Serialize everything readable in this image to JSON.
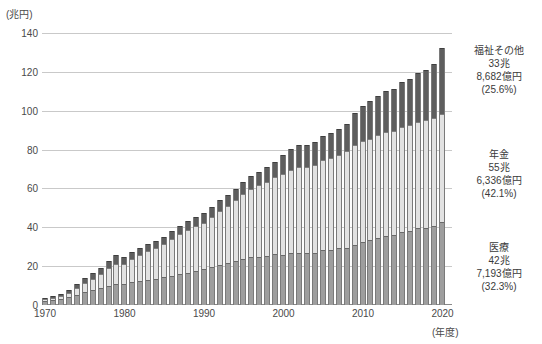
{
  "axis": {
    "unit_caption": "(兆円)",
    "x_unit_caption": "(年度)",
    "y_ticks": [
      "140",
      "120",
      "100",
      "80",
      "60",
      "40",
      "20",
      "0"
    ],
    "x_ticks": [
      "1970",
      "1980",
      "1990",
      "2000",
      "2010",
      "2020"
    ]
  },
  "annotations": {
    "welfare": {
      "name": "福祉その他",
      "amount_cho": "33兆",
      "amount_oku": "8,682億円",
      "share": "(25.6%)"
    },
    "pension": {
      "name": "年金",
      "amount_cho": "55兆",
      "amount_oku": "6,336億円",
      "share": "(42.1%)"
    },
    "medical": {
      "name": "医療",
      "amount_cho": "42兆",
      "amount_oku": "7,193億円",
      "share": "(32.3%)"
    }
  },
  "colors": {
    "welfare": "#5e5e5e",
    "pension": "#e2e2e2",
    "medical": "#9e9e9e",
    "gridline": "#c9c9c9",
    "axis": "#8a8a8a",
    "text": "#3a3a3a"
  },
  "chart_data": {
    "type": "bar",
    "stacked": true,
    "title": "",
    "xlabel": "(年度)",
    "ylabel": "(兆円)",
    "ylim": [
      0,
      140
    ],
    "ytick_step": 20,
    "grid": true,
    "legend": "right-side annotations",
    "categories": [
      "1970",
      "1971",
      "1972",
      "1973",
      "1974",
      "1975",
      "1976",
      "1977",
      "1978",
      "1979",
      "1980",
      "1981",
      "1982",
      "1983",
      "1984",
      "1985",
      "1986",
      "1987",
      "1988",
      "1989",
      "1990",
      "1991",
      "1992",
      "1993",
      "1994",
      "1995",
      "1996",
      "1997",
      "1998",
      "1999",
      "2000",
      "2001",
      "2002",
      "2003",
      "2004",
      "2005",
      "2006",
      "2007",
      "2008",
      "2009",
      "2010",
      "2011",
      "2012",
      "2013",
      "2014",
      "2015",
      "2016",
      "2017",
      "2018",
      "2019",
      "2020"
    ],
    "series": [
      {
        "name": "医療",
        "color": "#9e9e9e",
        "values": [
          2.1,
          2.5,
          3.1,
          3.9,
          5.4,
          6.5,
          7.6,
          8.6,
          10.0,
          11.0,
          10.7,
          11.6,
          12.4,
          13.0,
          13.4,
          14.3,
          15.1,
          15.9,
          16.6,
          17.5,
          18.4,
          19.4,
          20.6,
          21.5,
          22.4,
          23.6,
          24.6,
          24.9,
          25.3,
          26.1,
          26.0,
          26.7,
          26.6,
          26.6,
          27.0,
          28.1,
          28.4,
          29.2,
          29.6,
          30.8,
          32.3,
          33.6,
          34.3,
          35.3,
          36.0,
          37.7,
          38.2,
          39.4,
          39.7,
          40.7,
          42.7
        ]
      },
      {
        "name": "年金",
        "color": "#e2e2e2",
        "values": [
          0.9,
          1.2,
          1.6,
          2.2,
          3.4,
          4.6,
          5.9,
          7.3,
          8.9,
          10.3,
          10.5,
          12.1,
          13.5,
          14.8,
          15.9,
          16.9,
          19.0,
          20.5,
          22.0,
          23.3,
          24.0,
          25.9,
          27.9,
          29.6,
          31.5,
          33.5,
          35.1,
          36.7,
          38.2,
          39.6,
          41.2,
          42.8,
          44.5,
          44.6,
          45.0,
          46.3,
          47.3,
          48.0,
          49.5,
          51.7,
          52.2,
          52.1,
          53.0,
          53.6,
          53.4,
          54.1,
          54.4,
          54.8,
          55.3,
          55.5,
          55.6
        ]
      },
      {
        "name": "福祉その他",
        "color": "#5e5e5e",
        "values": [
          0.6,
          0.8,
          1.1,
          1.5,
          2.1,
          2.6,
          3.0,
          3.4,
          3.9,
          4.2,
          3.4,
          3.6,
          3.7,
          3.8,
          3.9,
          4.0,
          4.1,
          4.3,
          4.5,
          4.7,
          4.8,
          5.1,
          5.4,
          5.7,
          6.0,
          6.4,
          6.8,
          7.1,
          7.4,
          7.8,
          10.1,
          10.7,
          11.2,
          11.4,
          11.7,
          12.4,
          12.8,
          13.3,
          14.1,
          16.2,
          17.8,
          19.3,
          20.5,
          21.3,
          21.9,
          22.9,
          23.9,
          25.1,
          26.1,
          27.8,
          33.9
        ]
      }
    ],
    "total_2020": 132.2
  }
}
